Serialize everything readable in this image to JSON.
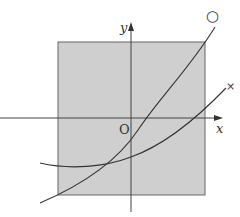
{
  "figure": {
    "type": "coordinate-plane-graph",
    "region_color": "#cfcfcf",
    "axis_color": "#444444",
    "curve_color": "#333333",
    "labels": {
      "x_axis": "x",
      "y_axis": "y",
      "origin": "O",
      "curve_a_marker": "○",
      "curve_b_marker": "×"
    },
    "curves": [
      {
        "name": "curve-circle",
        "marker": "○",
        "description": "steeper increasing curve"
      },
      {
        "name": "curve-cross",
        "marker": "×",
        "description": "flatter parabola-like curve"
      }
    ]
  }
}
